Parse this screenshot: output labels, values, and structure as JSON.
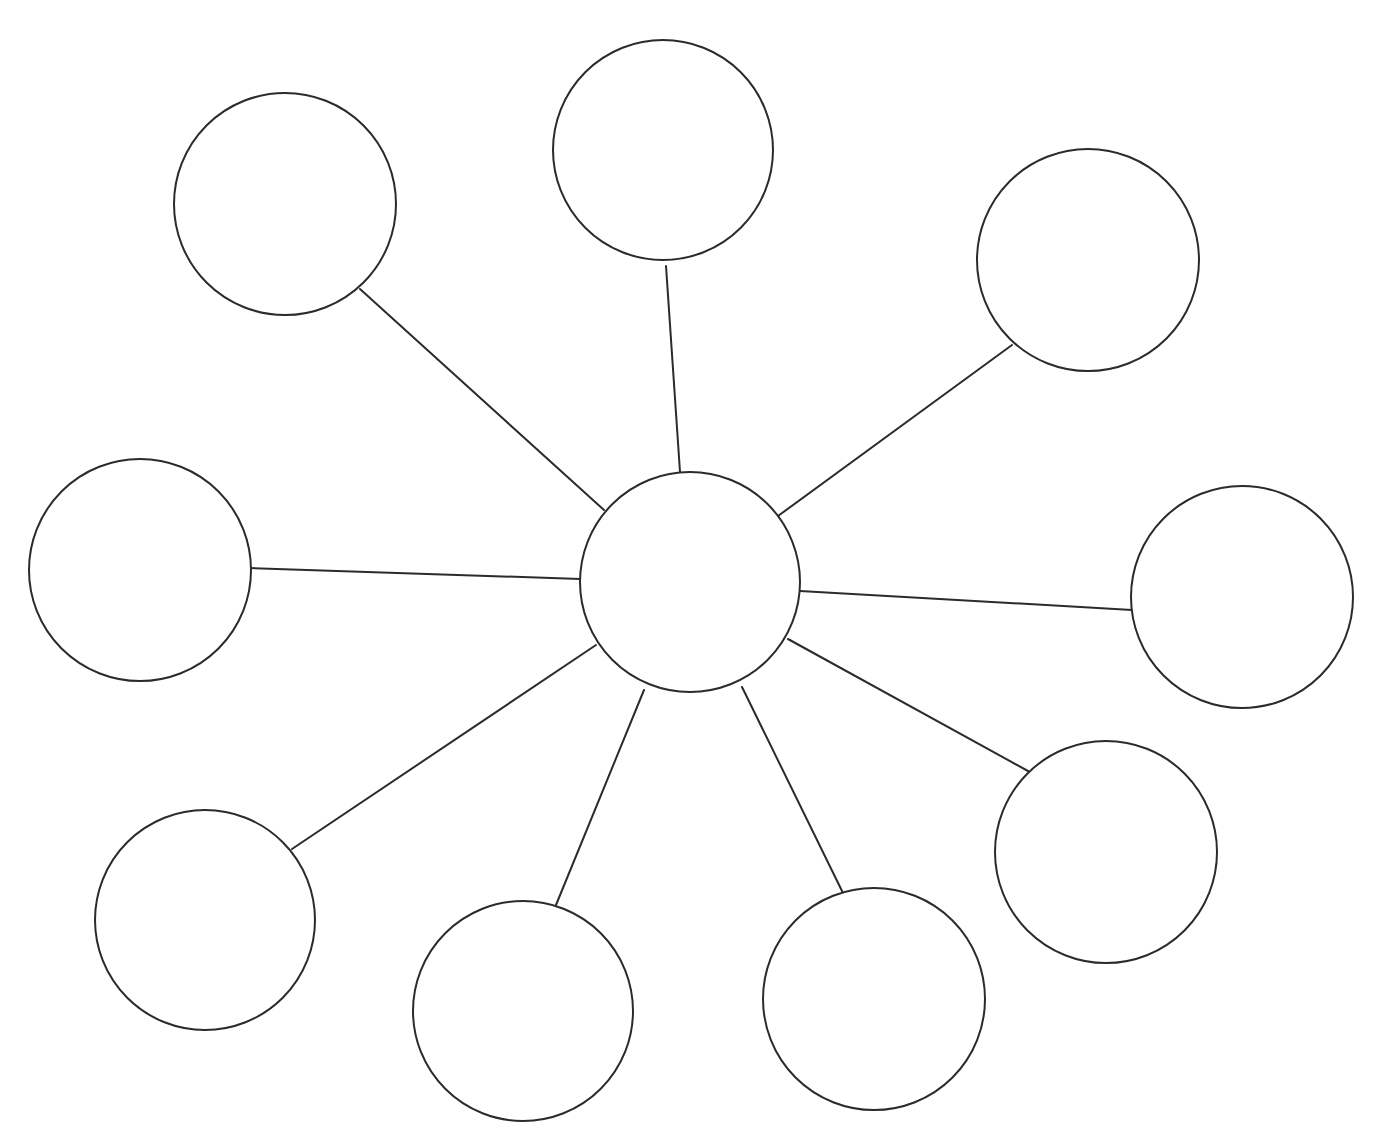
{
  "diagram": {
    "type": "spider-map",
    "stroke_color": "#2b2b2b",
    "fill_color": "#ffffff",
    "background_color": "#ffffff",
    "stroke_width": 2,
    "center": {
      "id": "center",
      "cx": 690,
      "cy": 582,
      "r": 110,
      "label": ""
    },
    "nodes": [
      {
        "id": "top",
        "cx": 663,
        "cy": 150,
        "r": 110,
        "label": ""
      },
      {
        "id": "upper-left",
        "cx": 285,
        "cy": 204,
        "r": 111,
        "label": ""
      },
      {
        "id": "upper-right",
        "cx": 1088,
        "cy": 260,
        "r": 111,
        "label": ""
      },
      {
        "id": "left",
        "cx": 140,
        "cy": 570,
        "r": 111,
        "label": ""
      },
      {
        "id": "right",
        "cx": 1242,
        "cy": 597,
        "r": 111,
        "label": ""
      },
      {
        "id": "lower-left",
        "cx": 205,
        "cy": 920,
        "r": 110,
        "label": ""
      },
      {
        "id": "lower-right",
        "cx": 1106,
        "cy": 852,
        "r": 111,
        "label": ""
      },
      {
        "id": "bottom-left-center",
        "cx": 523,
        "cy": 1011,
        "r": 110,
        "label": ""
      },
      {
        "id": "bottom-right-center",
        "cx": 874,
        "cy": 999,
        "r": 111,
        "label": ""
      }
    ],
    "spokes": [
      {
        "to": "top",
        "x1": 680,
        "y1": 472,
        "x2": 666,
        "y2": 266
      },
      {
        "to": "upper-left",
        "x1": 604,
        "y1": 510,
        "x2": 360,
        "y2": 289
      },
      {
        "to": "upper-right",
        "x1": 778,
        "y1": 516,
        "x2": 1012,
        "y2": 345
      },
      {
        "to": "left",
        "x1": 580,
        "y1": 579,
        "x2": 250,
        "y2": 568
      },
      {
        "to": "right",
        "x1": 800,
        "y1": 591,
        "x2": 1132,
        "y2": 610
      },
      {
        "to": "lower-left",
        "x1": 596,
        "y1": 645,
        "x2": 292,
        "y2": 849
      },
      {
        "to": "lower-right",
        "x1": 788,
        "y1": 639,
        "x2": 1028,
        "y2": 771
      },
      {
        "to": "bottom-left-center",
        "x1": 644,
        "y1": 690,
        "x2": 556,
        "y2": 905
      },
      {
        "to": "bottom-right-center",
        "x1": 742,
        "y1": 687,
        "x2": 843,
        "y2": 893
      }
    ]
  },
  "header": {
    "clipped_text": ""
  }
}
